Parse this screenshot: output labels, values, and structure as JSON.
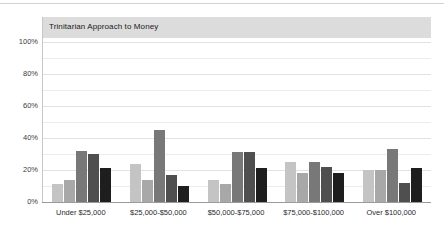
{
  "chart_data": {
    "type": "bar",
    "title": "Trinitarian Approach to Money",
    "xlabel": "",
    "ylabel": "",
    "ylim": [
      0,
      100
    ],
    "yticks": [
      "0%",
      "20%",
      "40%",
      "60%",
      "80%",
      "100%"
    ],
    "ytick_values": [
      0,
      20,
      40,
      60,
      80,
      100
    ],
    "grid": "horizontal gridlines every 10%",
    "legend": "none",
    "categories": [
      "Under $25,000",
      "$25,000-$50,000",
      "$50,000-$75,000",
      "$75,000-$100,000",
      "Over $100,000"
    ],
    "series": [
      {
        "name": "Series 1",
        "color": "#c4c4c4",
        "values": [
          11,
          24,
          14,
          25,
          20
        ]
      },
      {
        "name": "Series 2",
        "color": "#a8a8a8",
        "values": [
          14,
          14,
          11,
          18,
          20
        ]
      },
      {
        "name": "Series 3",
        "color": "#787878",
        "values": [
          32,
          45,
          31,
          25,
          33
        ]
      },
      {
        "name": "Series 4",
        "color": "#4f4f4f",
        "values": [
          30,
          17,
          31,
          22,
          12
        ]
      },
      {
        "name": "Series 5",
        "color": "#1e1e1e",
        "values": [
          21,
          10,
          21,
          18,
          21
        ]
      }
    ]
  },
  "style": {
    "title_band_color": "#dcdcdc",
    "axis_color": "#9a9a9a",
    "gridline_color": "#ececec",
    "background": "#ffffff"
  }
}
